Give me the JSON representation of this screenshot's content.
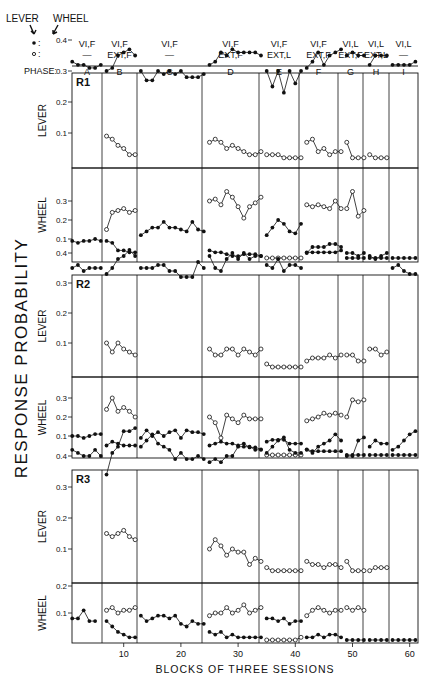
{
  "chart_data": {
    "type": "line",
    "title": "",
    "ylabel": "RESPONSE PROBABILITY",
    "xlabel": "BLOCKS OF THREE SESSIONS",
    "xticks": [
      10,
      20,
      30,
      40,
      50,
      60
    ],
    "legend": {
      "lever_label": "LEVER",
      "wheel_label": "WHEEL",
      "filled_marker": "•",
      "open_marker": "o",
      "filled_desc": "filled circles",
      "open_desc": "open circles"
    },
    "phase_label": "PHASE:",
    "phases": [
      {
        "id": "A",
        "filled": "VI,F",
        "open": "—",
        "start": 1,
        "end": 6
      },
      {
        "id": "B",
        "filled": "VI,F",
        "open": "EXT,F",
        "start": 7,
        "end": 12
      },
      {
        "id": "C",
        "filled": "VI,F",
        "open": "—",
        "start": 13,
        "end": 24
      },
      {
        "id": "D",
        "filled": "VI,F",
        "open": "EXT,F",
        "start": 25,
        "end": 34
      },
      {
        "id": "E",
        "filled": "VI,F",
        "open": "EXT,L",
        "start": 35,
        "end": 41
      },
      {
        "id": "F",
        "filled": "VI,F",
        "open": "EXT,F",
        "start": 42,
        "end": 48
      },
      {
        "id": "G",
        "filled": "VI,L",
        "open": "EXT,F",
        "start": 49,
        "end": 52
      },
      {
        "id": "H",
        "filled": "VI,L",
        "open": "EXT,L",
        "start": 53,
        "end": 56
      },
      {
        "id": "I",
        "filled": "VI,L",
        "open": "—",
        "start": 57,
        "end": 61
      }
    ],
    "subjects": [
      {
        "name": "R1",
        "lever": {
          "yticks": [
            0.1,
            0.2,
            0.3,
            0.4
          ],
          "filled": [
            [
              0.33,
              0.32,
              0.32,
              0.31,
              0.31,
              0.32
            ],
            [
              0.3,
              0.31,
              0.35,
              0.36,
              0.37,
              0.35
            ],
            [
              0.3,
              0.27,
              0.27,
              0.3,
              0.29,
              0.3,
              0.29,
              0.3,
              0.28,
              0.28,
              0.28,
              0.29
            ],
            [
              0.32,
              0.33,
              0.36,
              0.35,
              0.37,
              0.36,
              0.36,
              0.36,
              0.36,
              0.35
            ],
            [
              0.3,
              0.25,
              0.3,
              0.23,
              0.3,
              0.26,
              0.3
            ],
            [
              0.31,
              0.33,
              0.36,
              0.32,
              0.35,
              0.36,
              0.37
            ],
            [
              0.35,
              0.36,
              0.35,
              0.35
            ],
            [
              0.32,
              0.35,
              0.35,
              0.35
            ],
            [
              0.32,
              0.32,
              0.32,
              0.32,
              0.33
            ]
          ],
          "open": [
            null,
            [
              0.09,
              0.08,
              0.06,
              0.05,
              0.03,
              0.03
            ],
            null,
            [
              0.07,
              0.08,
              0.07,
              0.05,
              0.06,
              0.05,
              0.04,
              0.03,
              0.03,
              0.04
            ],
            [
              0.03,
              0.03,
              0.03,
              0.02,
              0.02,
              0.02,
              0.02
            ],
            [
              0.07,
              0.08,
              0.04,
              0.05,
              0.03,
              0.04,
              0.04
            ],
            [
              0.07,
              0.02,
              0.02,
              0.02
            ],
            [
              0.03,
              0.02,
              0.02,
              0.02
            ],
            null
          ]
        },
        "wheel": {
          "yticks": [
            0.1,
            0.2,
            0.3
          ],
          "filled": [
            [
              0.09,
              0.08,
              0.09,
              0.09,
              0.1,
              0.09
            ],
            [
              0.09,
              0.08,
              0.04,
              0.04,
              0.03,
              0.03
            ],
            [
              0.12,
              0.14,
              0.16,
              0.16,
              0.19,
              0.16,
              0.16,
              0.15,
              0.14,
              0.19,
              0.15,
              0.14
            ],
            [
              0.04,
              0.03,
              0.03,
              0.02,
              0.01,
              0.01,
              0.02,
              0.02,
              0.02,
              0.01
            ],
            [
              0.12,
              0.16,
              0.2,
              0.18,
              0.14,
              0.13,
              0.18
            ],
            [
              0.03,
              0.03,
              0.03,
              0.03,
              0.03,
              0.03,
              0.04
            ],
            [
              0.0,
              0.0,
              0.0,
              0.0
            ],
            [
              0.0,
              0.0,
              0.0,
              0.0
            ],
            [
              0.0,
              0.0,
              0.0,
              0.0,
              0.0
            ]
          ],
          "open": [
            null,
            [
              0.15,
              0.24,
              0.25,
              0.26,
              0.24,
              0.25
            ],
            null,
            [
              0.3,
              0.31,
              0.28,
              0.35,
              0.32,
              0.27,
              0.21,
              0.27,
              0.29,
              0.32
            ],
            [
              0.0,
              0.0,
              0.0,
              0.0,
              0.0,
              0.0,
              0.0
            ],
            [
              0.28,
              0.27,
              0.28,
              0.27,
              0.26,
              0.3,
              0.26
            ],
            [
              0.26,
              0.35,
              0.22,
              0.25
            ],
            null,
            null
          ]
        }
      },
      {
        "name": "R2",
        "lever": {
          "yticks": [
            0.1,
            0.2,
            0.3,
            0.4
          ],
          "filled": [
            [
              0.35,
              0.36,
              0.34,
              0.35,
              0.35,
              0.35
            ],
            [
              0.33,
              0.35,
              0.38,
              0.39,
              0.41,
              0.39
            ],
            [
              0.35,
              0.35,
              0.35,
              0.36,
              0.36,
              0.34,
              0.34,
              0.32,
              0.32,
              0.32,
              0.37,
              0.35
            ],
            [
              0.39,
              0.35,
              0.34,
              0.38,
              0.4,
              0.38,
              0.4,
              0.38,
              0.39,
              0.39
            ],
            [
              0.36,
              0.35,
              0.38,
              0.34,
              0.36,
              0.36,
              0.35
            ],
            [
              0.4,
              0.42,
              0.42,
              0.42,
              0.43,
              0.43,
              0.42
            ],
            [
              0.4,
              0.4,
              0.39,
              0.4
            ],
            [
              0.39,
              0.38,
              0.39,
              0.4
            ],
            [
              0.35,
              0.36,
              0.34,
              0.33,
              0.33
            ]
          ],
          "open": [
            null,
            [
              0.1,
              0.07,
              0.1,
              0.08,
              0.07,
              0.06
            ],
            null,
            [
              0.08,
              0.06,
              0.06,
              0.08,
              0.08,
              0.06,
              0.08,
              0.07,
              0.06,
              0.08
            ],
            [
              0.03,
              0.02,
              0.02,
              0.02,
              0.02,
              0.02,
              0.02
            ],
            [
              0.04,
              0.05,
              0.05,
              0.05,
              0.06,
              0.05,
              0.06
            ],
            [
              0.06,
              0.06,
              0.04,
              0.04
            ],
            [
              0.08,
              0.08,
              0.06,
              0.07
            ],
            null
          ]
        },
        "wheel": {
          "yticks": [
            0.1,
            0.2,
            0.3
          ],
          "filled": [
            [
              0.1,
              0.1,
              0.09,
              0.1,
              0.11,
              0.11
            ],
            [
              0.05,
              0.07,
              0.06,
              0.05,
              0.05,
              0.05
            ],
            [
              0.09,
              0.13,
              0.1,
              0.12,
              0.1,
              0.12,
              0.13,
              0.09,
              0.13,
              0.12,
              0.12,
              0.11
            ],
            [
              0.05,
              0.06,
              0.07,
              0.06,
              0.06,
              0.05,
              0.06,
              0.04,
              0.04,
              0.03
            ],
            [
              0.07,
              0.08,
              0.08,
              0.08,
              0.06,
              0.06,
              0.06
            ],
            [
              0.03,
              0.02,
              0.02,
              0.02,
              0.02,
              0.02,
              0.02
            ],
            [
              0.0,
              0.0,
              0.0,
              0.0
            ],
            [
              0.0,
              0.0,
              0.0,
              0.0
            ],
            [
              0.0,
              0.0,
              0.0,
              0.0,
              0.0
            ]
          ],
          "open": [
            null,
            [
              0.24,
              0.3,
              0.23,
              0.25,
              0.23,
              0.2
            ],
            null,
            [
              0.2,
              0.17,
              0.09,
              0.21,
              0.19,
              0.17,
              0.21,
              0.19,
              0.19,
              0.19
            ],
            [
              0.0,
              0.0,
              0.0,
              0.0,
              0.0,
              0.0,
              0.0
            ],
            [
              0.18,
              0.19,
              0.2,
              0.22,
              0.21,
              0.22,
              0.21
            ],
            [
              0.2,
              0.29,
              0.28,
              0.29
            ],
            null,
            null
          ]
        }
      },
      {
        "name": "R3",
        "lever": {
          "yticks": [
            0.1,
            0.2,
            0.3,
            0.4
          ],
          "filled": [
            [
              0.42,
              0.41,
              0.4,
              0.4,
              0.42,
              0.4
            ],
            [
              0.34,
              0.41,
              0.43,
              0.48,
              0.48,
              0.49
            ],
            [
              0.43,
              0.45,
              0.47,
              0.44,
              0.43,
              0.42,
              0.39,
              0.41,
              0.39,
              0.39,
              0.4,
              0.39
            ],
            [
              0.38,
              0.39,
              0.38,
              0.4,
              0.4,
              0.43,
              0.43,
              0.43,
              0.42,
              0.42
            ],
            [
              0.41,
              0.43,
              0.45,
              0.46,
              0.42,
              0.41,
              0.41
            ],
            [
              0.42,
              0.41,
              0.43,
              0.44,
              0.45,
              0.47,
              0.45
            ],
            [
              0.4,
              0.4,
              0.45,
              0.46
            ],
            [
              0.43,
              0.45,
              0.44,
              0.44
            ],
            [
              0.42,
              0.43,
              0.45,
              0.47,
              0.48
            ]
          ],
          "open": [
            null,
            [
              0.15,
              0.14,
              0.15,
              0.16,
              0.14,
              0.13
            ],
            null,
            [
              0.1,
              0.13,
              0.11,
              0.08,
              0.1,
              0.09,
              0.09,
              0.05,
              0.07,
              0.06
            ],
            [
              0.04,
              0.03,
              0.03,
              0.03,
              0.03,
              0.03,
              0.03
            ],
            [
              0.06,
              0.05,
              0.05,
              0.04,
              0.05,
              0.05,
              0.04
            ],
            [
              0.06,
              0.03,
              0.03,
              0.03
            ],
            [
              0.03,
              0.04,
              0.04,
              0.04
            ],
            null
          ]
        },
        "wheel": {
          "yticks": [
            0.1,
            0.2
          ],
          "filled": [
            [
              0.08,
              0.08,
              0.11,
              0.07,
              0.07
            ],
            [
              0.07,
              0.05,
              0.03,
              0.02,
              0.01,
              0.01
            ],
            [
              0.09,
              0.07,
              0.08,
              0.09,
              0.09,
              0.08,
              0.09,
              0.06,
              0.05,
              0.07,
              0.06,
              0.06
            ],
            [
              0.03,
              0.02,
              0.03,
              0.01,
              0.02,
              0.01,
              0.01,
              0.01,
              0.01,
              0.01
            ],
            [
              0.08,
              0.08,
              0.07,
              0.08,
              0.06,
              0.07,
              0.07
            ],
            [
              0.01,
              0.01,
              0.02,
              0.01,
              0.02,
              0.02,
              0.01
            ],
            [
              0.0,
              0.0,
              0.0,
              0.0
            ],
            [
              0.0,
              0.0,
              0.0,
              0.0
            ],
            [
              0.0,
              0.0,
              0.0,
              0.0,
              0.0
            ]
          ],
          "open": [
            null,
            [
              0.11,
              0.12,
              0.1,
              0.11,
              0.11,
              0.12
            ],
            null,
            [
              0.09,
              0.1,
              0.1,
              0.12,
              0.1,
              0.11,
              0.13,
              0.1,
              0.11,
              0.12
            ],
            [
              0.0,
              0.0,
              0.0,
              0.0,
              0.0,
              0.0,
              0.01
            ],
            [
              0.09,
              0.11,
              0.12,
              0.11,
              0.1,
              0.11,
              0.11
            ],
            [
              0.12,
              0.11,
              0.12,
              0.11
            ],
            null,
            null
          ]
        }
      }
    ],
    "panel_labels": {
      "lever": "LEVER",
      "wheel": "WHEEL"
    },
    "grid": false,
    "legend_position": "top"
  }
}
